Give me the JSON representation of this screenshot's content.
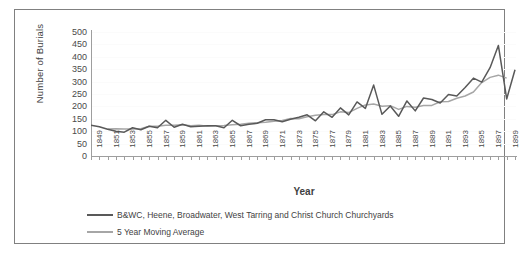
{
  "chart_data": {
    "type": "line",
    "title": "",
    "xlabel": "Year",
    "ylabel": "Number of Burials",
    "ylim": [
      0,
      500
    ],
    "ytick_step": 50,
    "yticks": [
      500,
      450,
      400,
      350,
      300,
      250,
      200,
      150,
      100,
      50,
      0
    ],
    "xlim": [
      1849,
      1900
    ],
    "xtick_labels": [
      "1849",
      "1851",
      "1853",
      "1855",
      "1857",
      "1859",
      "1861",
      "1863",
      "1865",
      "1867",
      "1869",
      "1871",
      "1873",
      "1875",
      "1877",
      "1879",
      "1881",
      "1883",
      "1885",
      "1887",
      "1889",
      "1891",
      "1893",
      "1895",
      "1897",
      "1899"
    ],
    "grid": true,
    "legend_position": "bottom-left",
    "x": [
      1849,
      1850,
      1851,
      1852,
      1853,
      1854,
      1855,
      1856,
      1857,
      1858,
      1859,
      1860,
      1861,
      1862,
      1863,
      1864,
      1865,
      1866,
      1867,
      1868,
      1869,
      1870,
      1871,
      1872,
      1873,
      1874,
      1875,
      1876,
      1877,
      1878,
      1879,
      1880,
      1881,
      1882,
      1883,
      1884,
      1885,
      1886,
      1887,
      1888,
      1889,
      1890,
      1891,
      1892,
      1893,
      1894,
      1895,
      1896,
      1897,
      1898,
      1899,
      1900
    ],
    "series": [
      {
        "name": "B&WC, Heene, Broadwater, West Tarring and Christ Church Churchyards",
        "color": "#595959",
        "values": [
          128,
          122,
          112,
          104,
          100,
          118,
          110,
          124,
          118,
          148,
          120,
          132,
          122,
          124,
          126,
          126,
          118,
          148,
          126,
          132,
          136,
          150,
          150,
          142,
          152,
          160,
          170,
          146,
          182,
          160,
          198,
          170,
          222,
          196,
          290,
          172,
          206,
          164,
          226,
          186,
          238,
          232,
          218,
          252,
          246,
          280,
          318,
          302,
          360,
          450,
          234,
          352
        ]
      },
      {
        "name": "5 Year Moving Average",
        "color": "#a6a6a6",
        "values": [
          null,
          null,
          113,
          114,
          113,
          113,
          114,
          124,
          124,
          128,
          128,
          130,
          126,
          128,
          124,
          126,
          127,
          130,
          132,
          136,
          138,
          140,
          144,
          147,
          155,
          154,
          162,
          168,
          171,
          171,
          182,
          179,
          196,
          210,
          214,
          205,
          207,
          192,
          204,
          201,
          208,
          208,
          223,
          224,
          237,
          246,
          262,
          300,
          321,
          330,
          318,
          null
        ]
      }
    ]
  },
  "legend": {
    "items": [
      {
        "label": "B&WC, Heene, Broadwater, West Tarring and Christ Church Churchyards",
        "color": "#595959"
      },
      {
        "label": "5 Year Moving Average",
        "color": "#a6a6a6"
      }
    ]
  },
  "axes": {
    "y_title": "Number of Burials",
    "x_title": "Year"
  }
}
